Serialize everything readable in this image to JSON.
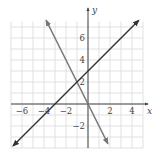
{
  "chart_data": {
    "type": "line",
    "title": "",
    "xlabel": "x",
    "ylabel": "y",
    "xlim": [
      -7,
      5
    ],
    "ylim": [
      -4,
      7.5
    ],
    "grid": true,
    "unit_per_grid": 1,
    "x_ticks": [
      {
        "value": -6,
        "label": "−6"
      },
      {
        "value": -4,
        "label": "−4"
      },
      {
        "value": -2,
        "label": "−2"
      },
      {
        "value": 2,
        "label": "2"
      },
      {
        "value": 4,
        "label": "4"
      }
    ],
    "y_ticks": [
      {
        "value": 6,
        "label": "6"
      },
      {
        "value": 4,
        "label": "4"
      },
      {
        "value": 2,
        "label": "2"
      },
      {
        "value": -2,
        "label": "−2"
      }
    ],
    "series": [
      {
        "name": "y = -2x",
        "equation": "y = -2x",
        "color": "#777777",
        "points": [
          [
            -3.8,
            7.6
          ],
          [
            0,
            0
          ],
          [
            1.8,
            -3.6
          ]
        ],
        "arrows": "both"
      },
      {
        "name": "y = x + 3",
        "equation": "y = x + 3",
        "color": "#333333",
        "points": [
          [
            -6.8,
            -3.8
          ],
          [
            -3,
            0
          ],
          [
            0,
            3
          ],
          [
            4.6,
            7.6
          ]
        ],
        "arrows": "both"
      }
    ],
    "intersection": [
      -1,
      2
    ],
    "legend": "none"
  },
  "labels": {
    "x_axis": "x",
    "y_axis": "y"
  },
  "colors": {
    "grid": "#d9d9d9",
    "axis": "#444444",
    "line_steep": "#777777",
    "line_shallow": "#333333"
  }
}
